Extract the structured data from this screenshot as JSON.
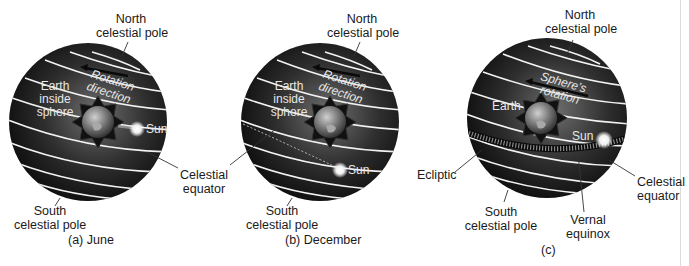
{
  "panels": [
    {
      "id": "a",
      "caption": "(a) June",
      "north_pole": [
        "North",
        "celestial pole"
      ],
      "south_pole": [
        "South",
        "celestial pole"
      ],
      "rotation": [
        "Rotation",
        "direction"
      ],
      "earth": [
        "Earth",
        "inside",
        "sphere"
      ],
      "sun": "Sun",
      "equator": [
        "Celestial",
        "equator"
      ]
    },
    {
      "id": "b",
      "caption": "(b) December",
      "north_pole": [
        "North",
        "celestial pole"
      ],
      "south_pole": [
        "South",
        "celestial pole"
      ],
      "rotation": [
        "Rotation",
        "direction"
      ],
      "earth": [
        "Earth",
        "inside",
        "sphere"
      ],
      "sun": "Sun"
    },
    {
      "id": "c",
      "caption": "(c)",
      "north_pole": [
        "North",
        "celestial pole"
      ],
      "south_pole": [
        "South",
        "celestial pole"
      ],
      "rotation": [
        "Sphere's",
        "rotation"
      ],
      "earth": [
        "Earth"
      ],
      "sun": "Sun",
      "equator": [
        "Celestial",
        "equator"
      ],
      "ecliptic": "Ecliptic",
      "vernal": [
        "Vernal",
        "equinox"
      ]
    }
  ],
  "colors": {
    "sphere_dark": "#141414",
    "sphere_mid": "#5a5a5a",
    "lines": "#f2f2f2",
    "background": "#ffffff"
  }
}
